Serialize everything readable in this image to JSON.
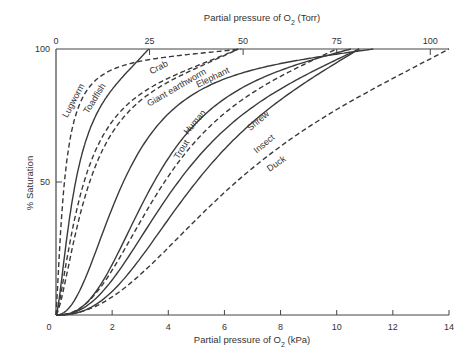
{
  "chart_data": {
    "type": "line",
    "title": "",
    "xlabel": "Partial pressure of O2 (kPa)",
    "xlabel_top": "Partial pressure of O2 (Torr)",
    "ylabel": "% Saturation",
    "xlim": [
      0,
      14
    ],
    "ylim": [
      0,
      100
    ],
    "x_ticks": [
      0,
      2,
      4,
      6,
      8,
      10,
      12,
      14
    ],
    "x_top_ticks": [
      0,
      25,
      50,
      75,
      100
    ],
    "y_ticks": [
      0,
      50,
      100
    ],
    "grid": false,
    "legend": "inline labels on curves",
    "series": [
      {
        "name": "Lugworm",
        "style": "dashed",
        "p50_kpa": 0.3,
        "hill_n": 1.3,
        "x_max": 6.6,
        "points": [
          [
            0,
            0
          ],
          [
            0.1,
            20
          ],
          [
            0.2,
            38
          ],
          [
            0.3,
            50
          ],
          [
            0.5,
            66
          ],
          [
            1.0,
            83
          ],
          [
            2.0,
            93
          ],
          [
            3.5,
            97
          ],
          [
            5.0,
            99
          ],
          [
            6.6,
            100
          ]
        ]
      },
      {
        "name": "Toadfish",
        "style": "solid",
        "p50_kpa": 0.7,
        "hill_n": 1.5,
        "x_max": 3.3,
        "points": [
          [
            0,
            0
          ],
          [
            0.2,
            14
          ],
          [
            0.4,
            30
          ],
          [
            0.7,
            50
          ],
          [
            1.0,
            63
          ],
          [
            1.5,
            76
          ],
          [
            2.0,
            85
          ],
          [
            2.7,
            94
          ],
          [
            3.3,
            100
          ]
        ]
      },
      {
        "name": "Crab",
        "style": "dashed",
        "p50_kpa": 1.0,
        "hill_n": 1.4,
        "x_max": 6.5,
        "points": [
          [
            0,
            0
          ],
          [
            0.3,
            15
          ],
          [
            0.6,
            32
          ],
          [
            1.0,
            50
          ],
          [
            1.5,
            63
          ],
          [
            2.5,
            78
          ],
          [
            3.5,
            87
          ],
          [
            5.0,
            95
          ],
          [
            6.5,
            99
          ]
        ]
      },
      {
        "name": "Giant earthworm",
        "style": "dashed",
        "p50_kpa": 1.2,
        "hill_n": 1.5,
        "x_max": 6.5,
        "points": [
          [
            0,
            0
          ],
          [
            0.4,
            15
          ],
          [
            0.8,
            32
          ],
          [
            1.2,
            50
          ],
          [
            1.8,
            63
          ],
          [
            2.8,
            77
          ],
          [
            4.0,
            88
          ],
          [
            5.2,
            95
          ],
          [
            6.5,
            98
          ]
        ]
      },
      {
        "name": "Elephant",
        "style": "solid",
        "p50_kpa": 2.4,
        "hill_n": 2.2,
        "x_max": 11.3,
        "points": [
          [
            0,
            0
          ],
          [
            0.8,
            8
          ],
          [
            1.5,
            26
          ],
          [
            2.4,
            50
          ],
          [
            3.5,
            69
          ],
          [
            5.0,
            82
          ],
          [
            6.5,
            90
          ],
          [
            8.0,
            95
          ],
          [
            9.7,
            98
          ],
          [
            11.3,
            100
          ]
        ]
      },
      {
        "name": "Human",
        "style": "solid",
        "p50_kpa": 3.5,
        "hill_n": 2.6,
        "x_max": 10.5,
        "points": [
          [
            0,
            0
          ],
          [
            1.0,
            4
          ],
          [
            2.0,
            17
          ],
          [
            3.0,
            38
          ],
          [
            3.5,
            50
          ],
          [
            4.5,
            67
          ],
          [
            6.0,
            83
          ],
          [
            7.5,
            92
          ],
          [
            9.0,
            96
          ],
          [
            10.5,
            98
          ]
        ]
      },
      {
        "name": "Trout",
        "style": "dashed",
        "p50_kpa": 3.9,
        "hill_n": 2.4,
        "x_max": 10.0,
        "points": [
          [
            0,
            0
          ],
          [
            1.0,
            4
          ],
          [
            2.0,
            15
          ],
          [
            3.0,
            32
          ],
          [
            3.9,
            50
          ],
          [
            5.0,
            66
          ],
          [
            6.5,
            80
          ],
          [
            8.0,
            89
          ],
          [
            10.0,
            96
          ]
        ]
      },
      {
        "name": "Shrew",
        "style": "solid",
        "p50_kpa": 4.4,
        "hill_n": 2.4,
        "x_max": 10.8,
        "points": [
          [
            0,
            0
          ],
          [
            1.0,
            3
          ],
          [
            2.0,
            12
          ],
          [
            3.0,
            27
          ],
          [
            4.4,
            50
          ],
          [
            5.5,
            64
          ],
          [
            7.0,
            79
          ],
          [
            8.5,
            89
          ],
          [
            9.8,
            95
          ],
          [
            10.8,
            98
          ]
        ]
      },
      {
        "name": "Insect",
        "style": "solid",
        "p50_kpa": 5.1,
        "hill_n": 2.5,
        "x_max": 10.8,
        "points": [
          [
            0,
            0
          ],
          [
            1.0,
            2
          ],
          [
            2.2,
            11
          ],
          [
            3.5,
            27
          ],
          [
            5.1,
            50
          ],
          [
            6.5,
            67
          ],
          [
            8.0,
            81
          ],
          [
            9.5,
            91
          ],
          [
            10.8,
            97
          ]
        ]
      },
      {
        "name": "Duck",
        "style": "dashed",
        "p50_kpa": 6.6,
        "hill_n": 2.2,
        "x_max": 14.0,
        "points": [
          [
            0,
            0
          ],
          [
            1.0,
            2
          ],
          [
            2.2,
            10
          ],
          [
            3.5,
            21
          ],
          [
            5.0,
            35
          ],
          [
            6.6,
            50
          ],
          [
            8.0,
            62
          ],
          [
            9.5,
            73
          ],
          [
            11.0,
            84
          ],
          [
            12.5,
            93
          ],
          [
            14.0,
            99
          ]
        ]
      }
    ]
  }
}
